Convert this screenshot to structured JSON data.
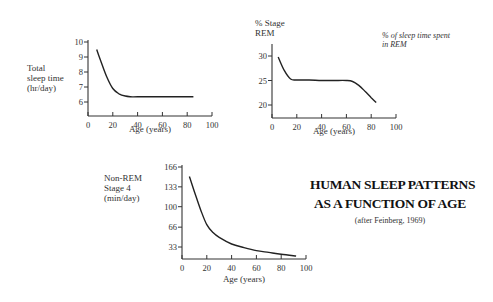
{
  "title": {
    "line1": "HUMAN SLEEP PATTERNS",
    "line2": "AS A FUNCTION OF AGE",
    "citation": "(after Feinberg, 1969)"
  },
  "chart_data": [
    {
      "type": "line",
      "title": "",
      "ylabel": "Total sleep time (hr/day)",
      "ylabel_lines": [
        "Total",
        "sleep time",
        "(hr/day)"
      ],
      "xlabel": "Age (years)",
      "xlim": [
        0,
        100
      ],
      "ylim": [
        5,
        10
      ],
      "xticks": [
        0,
        20,
        40,
        60,
        80,
        100
      ],
      "yticks": [
        6,
        7,
        8,
        9,
        10
      ],
      "grid": false,
      "x": [
        7,
        10,
        15,
        20,
        25,
        30,
        35,
        40,
        60,
        85
      ],
      "values": [
        9.5,
        8.8,
        7.7,
        6.9,
        6.55,
        6.4,
        6.35,
        6.35,
        6.35,
        6.35
      ]
    },
    {
      "type": "line",
      "title": "",
      "ylabel": "% Stage REM",
      "ylabel_lines": [
        "% Stage",
        "REM"
      ],
      "annotation": [
        "% of sleep time spent",
        "in REM"
      ],
      "xlabel": "Age (years)",
      "xlim": [
        0,
        100
      ],
      "ylim": [
        18,
        32
      ],
      "xticks": [
        0,
        20,
        40,
        60,
        80,
        100
      ],
      "yticks": [
        20,
        25,
        30
      ],
      "grid": false,
      "x": [
        5,
        10,
        15,
        20,
        30,
        40,
        50,
        60,
        65,
        70,
        75,
        80,
        84
      ],
      "values": [
        29.8,
        27.0,
        25.3,
        25.1,
        25.1,
        25.0,
        25.0,
        25.0,
        24.8,
        24.0,
        22.8,
        21.5,
        20.5
      ]
    },
    {
      "type": "line",
      "title": "",
      "ylabel": "Non-REM Stage 4 (min/day)",
      "ylabel_lines": [
        "Non-REM",
        "Stage 4",
        "(min/day)"
      ],
      "xlabel": "Age (years)",
      "xlim": [
        0,
        100
      ],
      "ylim": [
        0,
        166
      ],
      "xticks": [
        0,
        20,
        40,
        60,
        80,
        100
      ],
      "yticks": [
        33,
        66,
        100,
        133,
        166
      ],
      "grid": false,
      "x": [
        6,
        10,
        15,
        20,
        25,
        30,
        40,
        50,
        60,
        70,
        80,
        92
      ],
      "values": [
        150,
        125,
        95,
        70,
        57,
        49,
        38,
        32,
        27,
        24,
        21,
        18
      ]
    }
  ]
}
